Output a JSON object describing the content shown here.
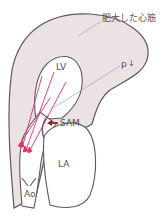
{
  "diagram": {
    "labels": {
      "hypertrophied_myocardium": "肥大した心筋",
      "pressure": "p",
      "pressure_arrow": "↓",
      "lv": "LV",
      "sam": "SAM",
      "la": "LA",
      "ao": "Ao"
    },
    "colors": {
      "myocardium_fill": "#ece2e4",
      "outline": "#5a5a5a",
      "flow_arrows": "#e0306a",
      "sam_arrow": "#a01c2c",
      "leader_line": "#999999"
    }
  }
}
